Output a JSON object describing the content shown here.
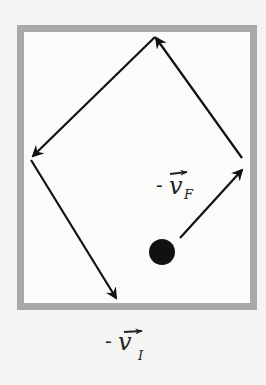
{
  "diagram": {
    "type": "ball-bouncing-in-box",
    "colors": {
      "background": "#f4f4f2",
      "box_border": "#a9a9a9",
      "box_fill": "#fbfbfa",
      "arrow": "#111111",
      "ball": "#111111"
    },
    "box": {
      "x": 20,
      "y": 28,
      "width": 234,
      "height": 279,
      "border_width": 7
    },
    "ball": {
      "cx": 162,
      "cy": 252,
      "r": 13
    },
    "path_segments": [
      {
        "name": "segment-right-to-top",
        "from": [
          242,
          158
        ],
        "to": [
          155,
          36
        ]
      },
      {
        "name": "segment-top-to-left",
        "from": [
          155,
          36
        ],
        "to": [
          31,
          158
        ]
      },
      {
        "name": "segment-left-to-bottom",
        "from": [
          31,
          158
        ],
        "to": [
          117,
          300
        ]
      }
    ],
    "velocity_arrow": {
      "from": [
        180,
        238
      ],
      "to": [
        243,
        168
      ]
    },
    "labels": {
      "final_velocity": {
        "minus": "-",
        "symbol": "v",
        "subscript": "F"
      },
      "initial_velocity": {
        "minus": "-",
        "symbol": "v",
        "subscript": "I"
      }
    }
  }
}
